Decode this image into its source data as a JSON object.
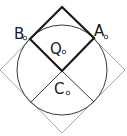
{
  "diagram": {
    "type": "geometry",
    "labels": {
      "A": "A",
      "B": "B",
      "Q": "Q",
      "C": "C"
    },
    "colors": {
      "bold_square": "#1a1a1a",
      "circle": "#3a3a3a",
      "outer_square": "#a8a8a8",
      "radii": "#3a3a3a",
      "point_marker": "#1a1a1a"
    },
    "elements": [
      {
        "id": "outer-square",
        "kind": "rotated-square",
        "points": [
          [
            62,
            7
          ],
          [
            125,
            70
          ],
          [
            62,
            133
          ],
          [
            0,
            70
          ]
        ]
      },
      {
        "id": "circle",
        "kind": "circle",
        "center": [
          62,
          70
        ],
        "radius": 45
      },
      {
        "id": "bold-square",
        "kind": "rotated-square",
        "points": [
          [
            62,
            7
          ],
          [
            94,
            38
          ],
          [
            62,
            71
          ],
          [
            30,
            39
          ]
        ]
      },
      {
        "id": "radius-left",
        "kind": "segment",
        "from": [
          62,
          71
        ],
        "to": [
          31,
          102
        ]
      },
      {
        "id": "radius-right",
        "kind": "segment",
        "from": [
          62,
          71
        ],
        "to": [
          94,
          102
        ]
      }
    ]
  }
}
